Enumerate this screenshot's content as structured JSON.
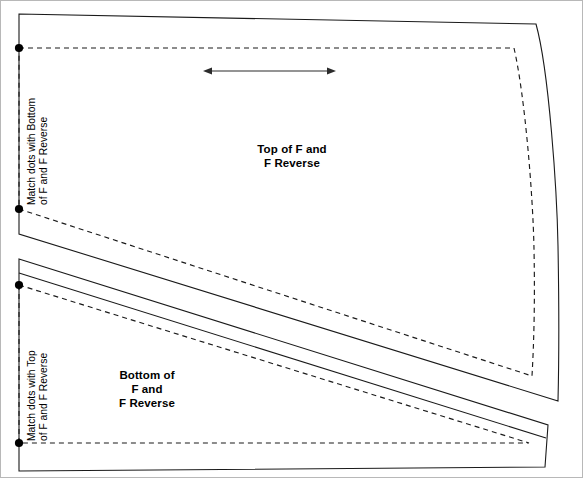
{
  "document": {
    "kind": "sewing-pattern-sheet",
    "width": 583,
    "height": 478,
    "background_color": "#ffffff",
    "line_color": "#1a1a1a"
  },
  "pieces": {
    "top": {
      "label": "Top of F and\nF Reverse",
      "match_note": "Match dots with Bottom\nof F and F Reverse",
      "grainline": {
        "name": "grainline-arrow",
        "style": "double-headed-arrow",
        "x1": 203,
        "x2": 334,
        "y": 70
      },
      "match_dots": [
        {
          "x": 18,
          "y": 47
        },
        {
          "x": 18,
          "y": 208
        }
      ]
    },
    "bottom": {
      "label": "Bottom of\nF and\nF Reverse",
      "match_note": "Match dots with Top\nof F and F Reverse",
      "match_dots": [
        {
          "x": 18,
          "y": 284
        },
        {
          "x": 18,
          "y": 442
        }
      ]
    }
  },
  "legend": {
    "cutting_line": "solid",
    "stitching_line": "dashed"
  }
}
